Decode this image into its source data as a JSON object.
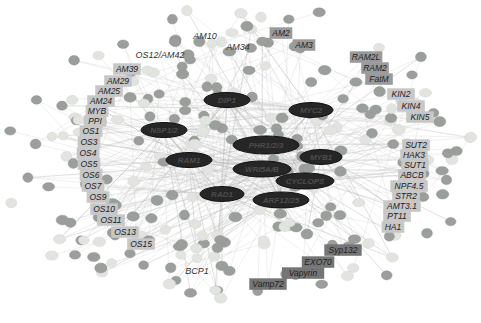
{
  "figure": {
    "kind": "gene-coexpression-network",
    "width": 481,
    "height": 323,
    "background": "#ffffff"
  },
  "colors": {
    "edge": "#c6c6c6",
    "edge_dark": "#aaaaaa",
    "dot_medium": "#9b9f9b",
    "dot_light": "#e2e4e0",
    "dot_stroke": "#8d918d",
    "hub_fill": "#262626",
    "hub_stroke": "#111111",
    "hub_text": "#4d4d4d",
    "label_light_bg": "#c7c7c7",
    "label_medium_bg": "#9a9a9a",
    "label_dark_bg": "#757575",
    "label_text": "#222222",
    "label_plain_text": "#333333"
  },
  "network": {
    "background_nodes": {
      "count": 250,
      "seed": 1337,
      "cx": 243,
      "cy": 160,
      "rx": 233,
      "ry": 149
    },
    "hubs": [
      {
        "label": "DIP1",
        "x": 227,
        "y": 100,
        "w": 46,
        "h": 15
      },
      {
        "label": "MYC2",
        "x": 311,
        "y": 110,
        "w": 44,
        "h": 15
      },
      {
        "label": "NSP1/2",
        "x": 164,
        "y": 130,
        "w": 46,
        "h": 15
      },
      {
        "label": "PHR1/2/3",
        "x": 266,
        "y": 145,
        "w": 66,
        "h": 18
      },
      {
        "label": "RAM1",
        "x": 189,
        "y": 160,
        "w": 46,
        "h": 15
      },
      {
        "label": "MYB1",
        "x": 321,
        "y": 157,
        "w": 42,
        "h": 15
      },
      {
        "label": "WRI5A/B",
        "x": 262,
        "y": 169,
        "w": 58,
        "h": 16
      },
      {
        "label": "CYCLOPS",
        "x": 305,
        "y": 181,
        "w": 58,
        "h": 16
      },
      {
        "label": "RAD1",
        "x": 222,
        "y": 194,
        "w": 44,
        "h": 15
      },
      {
        "label": "ARF12/25",
        "x": 281,
        "y": 200,
        "w": 56,
        "h": 16
      }
    ],
    "peripheral_labels": [
      {
        "text": "AM10",
        "x": 205,
        "y": 36,
        "style": "plain"
      },
      {
        "text": "AM34",
        "x": 238,
        "y": 47,
        "style": "plain"
      },
      {
        "text": "OS12/AM42",
        "x": 160,
        "y": 55,
        "style": "plain"
      },
      {
        "text": "AM39",
        "x": 127,
        "y": 69,
        "style": "light"
      },
      {
        "text": "AM29",
        "x": 118,
        "y": 81,
        "style": "light"
      },
      {
        "text": "AM25",
        "x": 109,
        "y": 91,
        "style": "light"
      },
      {
        "text": "AM24",
        "x": 101,
        "y": 101,
        "style": "light"
      },
      {
        "text": "MYB",
        "x": 97,
        "y": 111,
        "style": "light"
      },
      {
        "text": "PPI",
        "x": 95,
        "y": 121,
        "style": "light"
      },
      {
        "text": "OS1",
        "x": 91,
        "y": 131,
        "style": "light"
      },
      {
        "text": "OS3",
        "x": 89,
        "y": 142,
        "style": "light"
      },
      {
        "text": "OS4",
        "x": 88,
        "y": 153,
        "style": "light"
      },
      {
        "text": "OS5",
        "x": 89,
        "y": 164,
        "style": "light"
      },
      {
        "text": "OS6",
        "x": 91,
        "y": 175,
        "style": "light"
      },
      {
        "text": "OS7",
        "x": 93,
        "y": 186,
        "style": "light"
      },
      {
        "text": "OS9",
        "x": 98,
        "y": 197,
        "style": "light"
      },
      {
        "text": "OS10",
        "x": 104,
        "y": 209,
        "style": "light"
      },
      {
        "text": "OS11",
        "x": 111,
        "y": 220,
        "style": "light"
      },
      {
        "text": "OS13",
        "x": 125,
        "y": 232,
        "style": "light"
      },
      {
        "text": "OS15",
        "x": 141,
        "y": 244,
        "style": "light"
      },
      {
        "text": "BCP1",
        "x": 197,
        "y": 271,
        "style": "plain"
      },
      {
        "text": "AM2",
        "x": 281,
        "y": 33,
        "style": "medium"
      },
      {
        "text": "AM3",
        "x": 304,
        "y": 45,
        "style": "medium"
      },
      {
        "text": "RAM2L",
        "x": 366,
        "y": 57,
        "style": "medium"
      },
      {
        "text": "RAM2",
        "x": 375,
        "y": 68,
        "style": "medium"
      },
      {
        "text": "FatM",
        "x": 379,
        "y": 79,
        "style": "medium"
      },
      {
        "text": "KIN2",
        "x": 401,
        "y": 94,
        "style": "light"
      },
      {
        "text": "KIN4",
        "x": 411,
        "y": 106,
        "style": "light"
      },
      {
        "text": "KIN5",
        "x": 420,
        "y": 117,
        "style": "light"
      },
      {
        "text": "SUT2",
        "x": 416,
        "y": 145,
        "style": "light"
      },
      {
        "text": "HAK3",
        "x": 414,
        "y": 155,
        "style": "light"
      },
      {
        "text": "SUT1",
        "x": 415,
        "y": 165,
        "style": "light"
      },
      {
        "text": "ABCB",
        "x": 412,
        "y": 175,
        "style": "light"
      },
      {
        "text": "NPF4.5",
        "x": 409,
        "y": 186,
        "style": "light"
      },
      {
        "text": "STR2",
        "x": 406,
        "y": 196,
        "style": "light"
      },
      {
        "text": "AMT3.1",
        "x": 402,
        "y": 206,
        "style": "light"
      },
      {
        "text": "PT11",
        "x": 397,
        "y": 216,
        "style": "light"
      },
      {
        "text": "HA1",
        "x": 393,
        "y": 227,
        "style": "light"
      },
      {
        "text": "Syp132",
        "x": 343,
        "y": 250,
        "style": "dark"
      },
      {
        "text": "EXO70",
        "x": 318,
        "y": 262,
        "style": "dark"
      },
      {
        "text": "Vapyrin",
        "x": 303,
        "y": 273,
        "style": "dark"
      },
      {
        "text": "Vamp72",
        "x": 268,
        "y": 284,
        "style": "dark"
      }
    ]
  }
}
